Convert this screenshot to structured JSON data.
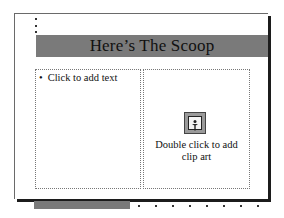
{
  "slide": {
    "title": "Here’s The Scoop",
    "left_placeholder": {
      "bullet": "•",
      "text": "Click to add text"
    },
    "right_placeholder": {
      "icon": "clip-art-icon",
      "caption_line1": "Double click to add",
      "caption_line2": "clip art"
    }
  },
  "colors": {
    "title_bar": "#7a7a7a",
    "footer_bar": "#7a7a7a",
    "shadow": "#1c1c1c"
  }
}
